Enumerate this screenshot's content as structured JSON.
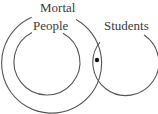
{
  "diagram": {
    "type": "venn",
    "sets": [
      {
        "name": "mortal",
        "label": "Mortal",
        "cx": 52,
        "cy": 63,
        "r": 50
      },
      {
        "name": "people",
        "label": "People",
        "cx": 47,
        "cy": 62,
        "r": 33
      },
      {
        "name": "students",
        "label": "Students",
        "cx": 126,
        "cy": 63,
        "r": 33
      }
    ],
    "point": {
      "cx": 97,
      "cy": 60,
      "r": 2.2,
      "meaning": "something in Mortal and Students but not People"
    },
    "stroke_color": "#555555",
    "background": "#ffffff"
  }
}
